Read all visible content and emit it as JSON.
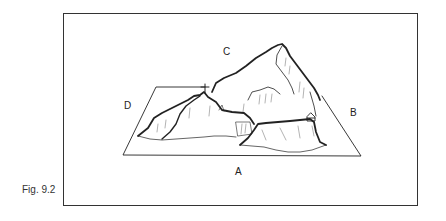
{
  "figure": {
    "caption": "Fig. 9.2",
    "labels": {
      "a": "A",
      "b": "B",
      "c": "C",
      "d": "D"
    },
    "markers": [
      "summit-cross",
      "hut"
    ]
  }
}
